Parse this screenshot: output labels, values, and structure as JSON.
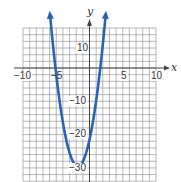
{
  "chart_data": {
    "type": "line",
    "title": "",
    "xlabel": "x",
    "ylabel": "y",
    "xlim": [
      -10,
      10
    ],
    "ylim": [
      -32,
      14
    ],
    "x_ticks": [
      -10,
      -5,
      5,
      10
    ],
    "x_tick_labels": [
      "−10",
      "−5",
      "5",
      "10"
    ],
    "y_ticks": [
      10,
      -10,
      -20,
      -30
    ],
    "y_tick_labels": [
      "10",
      "−10",
      "−20",
      "−30"
    ],
    "grid": true,
    "grid_step_x": 1,
    "grid_step_y": 2,
    "series": [
      {
        "name": "parabola",
        "equation_approx": "y = 2.6(x + 1.75)^2 - 29.5",
        "vertex": [
          -1.75,
          -29.5
        ],
        "x_intercepts_approx": [
          -5.1,
          1.6
        ],
        "a": 2.6,
        "h": -1.75,
        "k": -29.5,
        "arrows_at_ends": true,
        "color": "#2a62b4"
      }
    ]
  },
  "colors": {
    "grid": "#9a9aa0",
    "axis": "#444444",
    "curve": "#2a62b4"
  }
}
